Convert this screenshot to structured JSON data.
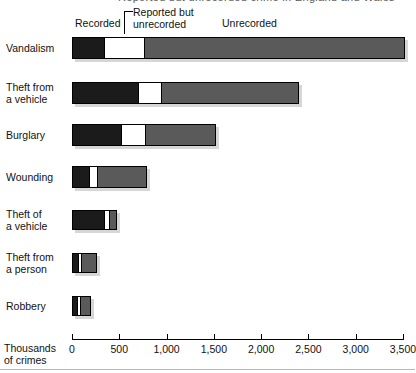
{
  "top_partial_text": "Reported but unrecorded crime in England and Wales",
  "legend": {
    "recorded": "Recorded",
    "reported_but_unrecorded": "Reported but\nunrecorded",
    "unrecorded": "Unrecorded"
  },
  "axis": {
    "title": "Thousands\nof crimes",
    "ticks": [
      "0",
      "500",
      "1,000",
      "1,500",
      "2,000",
      "2,500",
      "3,000",
      "3,500"
    ],
    "tick_values": [
      0,
      500,
      1000,
      1500,
      2000,
      2500,
      3000,
      3500
    ],
    "min": 0,
    "max": 3500
  },
  "colors": {
    "recorded": "#1b1b1b",
    "reported_but_unrecorded": "#ffffff",
    "unrecorded": "#5a5a5a",
    "outline": "#000000",
    "background": "#ffffff"
  },
  "chart_data": {
    "type": "bar",
    "orientation": "horizontal",
    "stacked": true,
    "title": "",
    "subtitle": "",
    "xlabel": "Thousands of crimes",
    "ylabel": "",
    "xlim": [
      0,
      3500
    ],
    "grid": false,
    "legend_position": "top",
    "categories": [
      "Vandalism",
      "Theft from a vehicle",
      "Burglary",
      "Wounding",
      "Theft of a vehicle",
      "Theft from a person",
      "Robbery"
    ],
    "series": [
      {
        "name": "Recorded",
        "values": [
          335,
          690,
          510,
          175,
          345,
          55,
          45
        ]
      },
      {
        "name": "Reported but unrecorded",
        "values": [
          435,
          255,
          275,
          100,
          65,
          45,
          45
        ]
      },
      {
        "name": "Unrecorded",
        "values": [
          2750,
          1455,
          740,
          515,
          65,
          165,
          110
        ]
      }
    ],
    "totals": [
      3520,
      2400,
      1525,
      790,
      475,
      265,
      200
    ]
  },
  "rows": [
    {
      "label": "Vandalism",
      "segments": [
        335,
        435,
        2750
      ]
    },
    {
      "label": "Theft from\na vehicle",
      "segments": [
        690,
        255,
        1455
      ]
    },
    {
      "label": "Burglary",
      "segments": [
        510,
        275,
        740
      ]
    },
    {
      "label": "Wounding",
      "segments": [
        175,
        100,
        515
      ]
    },
    {
      "label": "Theft of\na vehicle",
      "segments": [
        345,
        65,
        65
      ]
    },
    {
      "label": "Theft from\na person",
      "segments": [
        55,
        45,
        165
      ]
    },
    {
      "label": "Robbery",
      "segments": [
        45,
        45,
        110
      ]
    }
  ]
}
